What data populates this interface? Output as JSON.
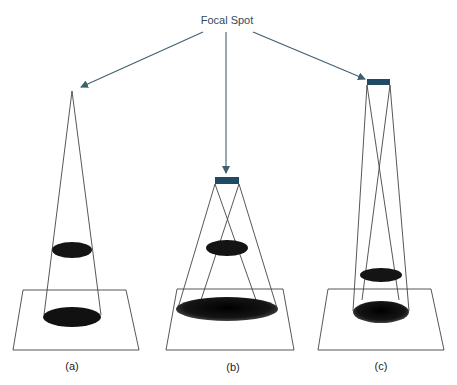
{
  "diagram": {
    "title": "Focal Spot",
    "colors": {
      "arrow": "#3f5f6f",
      "focal_spot": "#1f4a66",
      "lines": "#444444",
      "shadow": "#111111"
    },
    "panels": [
      {
        "label": "(a)",
        "focal_spot": "point"
      },
      {
        "label": "(b)",
        "focal_spot": "wide, close to object"
      },
      {
        "label": "(c)",
        "focal_spot": "wide, far from object"
      }
    ]
  }
}
